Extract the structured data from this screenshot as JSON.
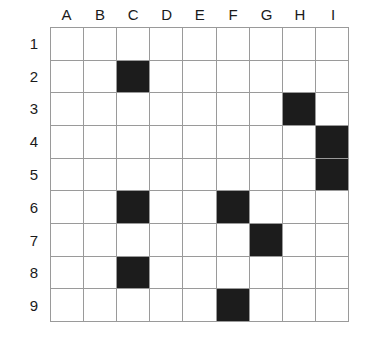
{
  "figure": {
    "kind": "grid-chart",
    "background_color": "#ffffff",
    "grid_line_color": "#9a9a9a",
    "filled_cell_color": "#1c1c1c",
    "empty_cell_color": "#ffffff",
    "label_color": "#1a1a1a"
  },
  "chart_data": {
    "type": "heatmap",
    "title": "",
    "xlabel": "",
    "ylabel": "",
    "columns": 9,
    "rows": 9,
    "legend": [],
    "grid": true,
    "column_labels": [
      "A",
      "B",
      "C",
      "D",
      "E",
      "F",
      "G",
      "H",
      "I"
    ],
    "row_labels": [
      "1",
      "2",
      "3",
      "4",
      "5",
      "6",
      "7",
      "8",
      "9"
    ],
    "value_meaning": {
      "0": "empty",
      "1": "filled"
    },
    "filled_cells": [
      "C2",
      "H3",
      "I4",
      "I5",
      "C6",
      "F6",
      "G7",
      "C8",
      "F9"
    ],
    "filled_count": 9,
    "matrix": [
      [
        0,
        0,
        0,
        0,
        0,
        0,
        0,
        0,
        0
      ],
      [
        0,
        0,
        1,
        0,
        0,
        0,
        0,
        0,
        0
      ],
      [
        0,
        0,
        0,
        0,
        0,
        0,
        0,
        1,
        0
      ],
      [
        0,
        0,
        0,
        0,
        0,
        0,
        0,
        0,
        1
      ],
      [
        0,
        0,
        0,
        0,
        0,
        0,
        0,
        0,
        1
      ],
      [
        0,
        0,
        1,
        0,
        0,
        1,
        0,
        0,
        0
      ],
      [
        0,
        0,
        0,
        0,
        0,
        0,
        1,
        0,
        0
      ],
      [
        0,
        0,
        1,
        0,
        0,
        0,
        0,
        0,
        0
      ],
      [
        0,
        0,
        0,
        0,
        0,
        1,
        0,
        0,
        0
      ]
    ]
  }
}
